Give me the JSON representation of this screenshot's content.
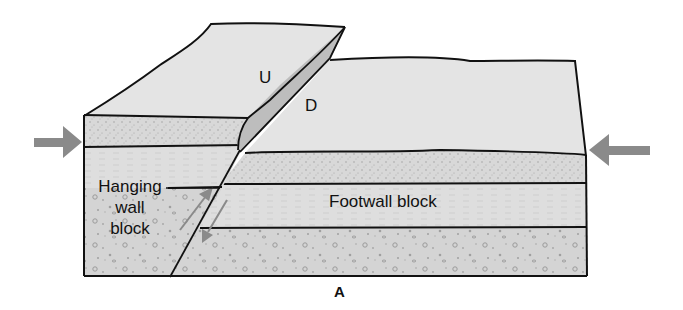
{
  "diagram": {
    "type": "block diagram",
    "labels": {
      "upthrown_side": "U",
      "downthrown_side": "D",
      "hanging_wall_line1": "Hanging",
      "hanging_wall_line2": "wall",
      "hanging_wall_line3": "block",
      "footwall": "Footwall block",
      "figure_letter": "A"
    },
    "arrows": [
      {
        "name": "compression-arrow-left",
        "direction": "right"
      },
      {
        "name": "compression-arrow-right",
        "direction": "left"
      },
      {
        "name": "slip-arrow-hanging-wall",
        "direction": "up"
      },
      {
        "name": "slip-arrow-footwall",
        "direction": "down"
      }
    ],
    "colors": {
      "surface": "#e4e4e4",
      "scarp": "#bdbdbd",
      "sand_layer": "#d6d6d6",
      "fine_layer": "#dcdcdc",
      "conglomerate_layer": "#d2d2d2",
      "arrow": "#8a8a8a",
      "outline": "#111111"
    }
  }
}
